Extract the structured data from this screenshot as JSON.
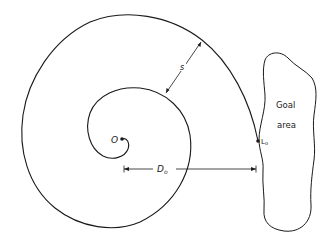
{
  "diagram": {
    "type": "spiral-search-path",
    "labels": {
      "origin": "O",
      "spacing": "s",
      "distance": "D",
      "distance_sub": "o",
      "goal_point": "L",
      "goal_point_sub": "o",
      "goal_line1": "Goal",
      "goal_line2": "area"
    },
    "colors": {
      "stroke": "#1a1a1a",
      "background": "#ffffff"
    }
  }
}
